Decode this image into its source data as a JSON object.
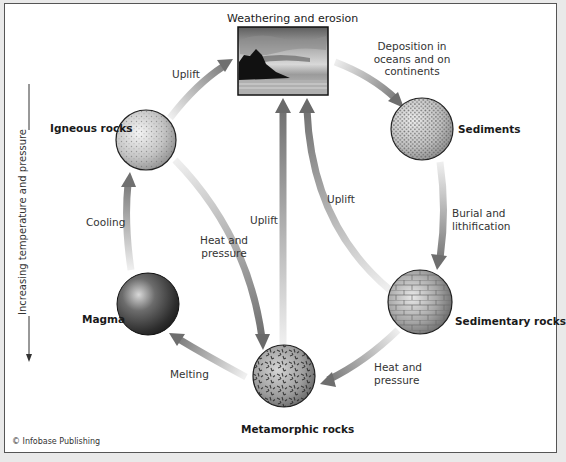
{
  "diagram": {
    "type": "rock-cycle",
    "title": "Weathering and erosion",
    "credit": "© Infobase Publishing",
    "side_axis": {
      "label": "Increasing temperature and pressure",
      "direction": "downward"
    },
    "nodes": {
      "weathering": "Weathering and erosion",
      "sediments": "Sediments",
      "sedimentary": "Sedimentary rocks",
      "metamorphic": "Metamorphic rocks",
      "magma": "Magma",
      "igneous": "Igneous rocks"
    },
    "processes": {
      "deposition": [
        "Deposition in",
        "oceans and on",
        "continents"
      ],
      "burial": [
        "Burial and",
        "lithification"
      ],
      "sed_to_meta": [
        "Heat and",
        "pressure"
      ],
      "melting": "Melting",
      "cooling": "Cooling",
      "uplift_igneous": "Uplift",
      "ign_to_meta": [
        "Heat and",
        "pressure"
      ],
      "uplift_meta": "Uplift",
      "uplift_sed": "Uplift"
    },
    "edges": [
      {
        "from": "Weathering and erosion",
        "to": "Sediments",
        "label": "Deposition in oceans and on continents"
      },
      {
        "from": "Sediments",
        "to": "Sedimentary rocks",
        "label": "Burial and lithification"
      },
      {
        "from": "Sedimentary rocks",
        "to": "Metamorphic rocks",
        "label": "Heat and pressure"
      },
      {
        "from": "Metamorphic rocks",
        "to": "Magma",
        "label": "Melting"
      },
      {
        "from": "Magma",
        "to": "Igneous rocks",
        "label": "Cooling"
      },
      {
        "from": "Igneous rocks",
        "to": "Weathering and erosion",
        "label": "Uplift"
      },
      {
        "from": "Igneous rocks",
        "to": "Metamorphic rocks",
        "label": "Heat and pressure"
      },
      {
        "from": "Metamorphic rocks",
        "to": "Weathering and erosion",
        "label": "Uplift"
      },
      {
        "from": "Sedimentary rocks",
        "to": "Weathering and erosion",
        "label": "Uplift"
      }
    ],
    "colors": {
      "arrow_dark": "#6e6e6e",
      "arrow_light": "#e2e2e2",
      "frame": "#555555"
    }
  }
}
